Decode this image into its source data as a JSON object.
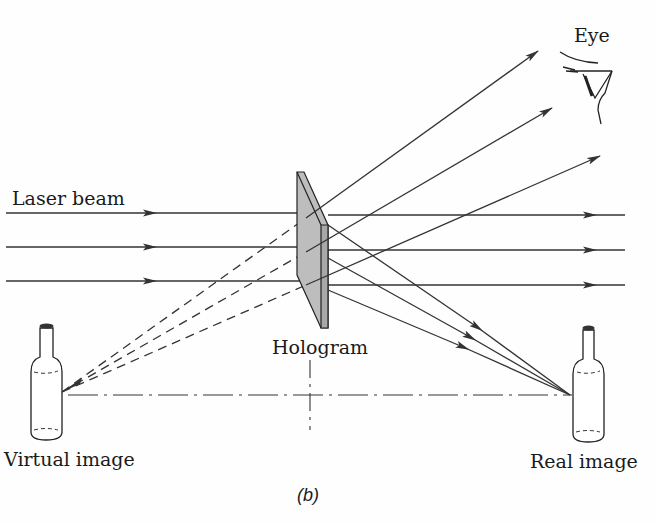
{
  "diagram": {
    "type": "optics-ray-diagram",
    "labels": {
      "eye": "Eye",
      "laser_beam": "Laser beam",
      "hologram": "Hologram",
      "virtual_image": "Virtual image",
      "real_image": "Real image",
      "caption": "(b)"
    },
    "colors": {
      "line": "#333333",
      "hologram_face": "#bdbdbd",
      "hologram_edge": "#a8a8a8",
      "background": "#ffffff"
    },
    "elements": [
      {
        "id": "laser-beams",
        "count": 3,
        "style": "solid",
        "direction": "left-to-right"
      },
      {
        "id": "hologram-plate",
        "style": "shaded slab"
      },
      {
        "id": "diverging-rays",
        "count": 3,
        "target": "eye"
      },
      {
        "id": "virtual-image-rays",
        "count": 3,
        "style": "dashed",
        "source": "virtual image bottle"
      },
      {
        "id": "converging-rays",
        "count": 3,
        "target": "real image bottle"
      },
      {
        "id": "optical-axis",
        "style": "dash-dot"
      }
    ]
  }
}
